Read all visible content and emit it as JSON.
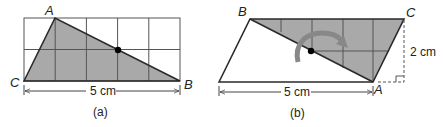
{
  "figure_a": {
    "caption": "(a)",
    "vertex_labels": {
      "A": "A",
      "B": "B",
      "C": "C"
    },
    "width_label": "5 cm",
    "grid": {
      "columns": 5,
      "rows": 2
    }
  },
  "figure_b": {
    "caption": "(b)",
    "vertex_labels": {
      "A": "A",
      "B": "B",
      "C": "C"
    },
    "width_label": "5 cm",
    "height_label": "2 cm"
  },
  "colors": {
    "shade": "#a9a9a9",
    "line": "#2a2a2a",
    "grid": "#555555",
    "arrow": "#808080"
  }
}
